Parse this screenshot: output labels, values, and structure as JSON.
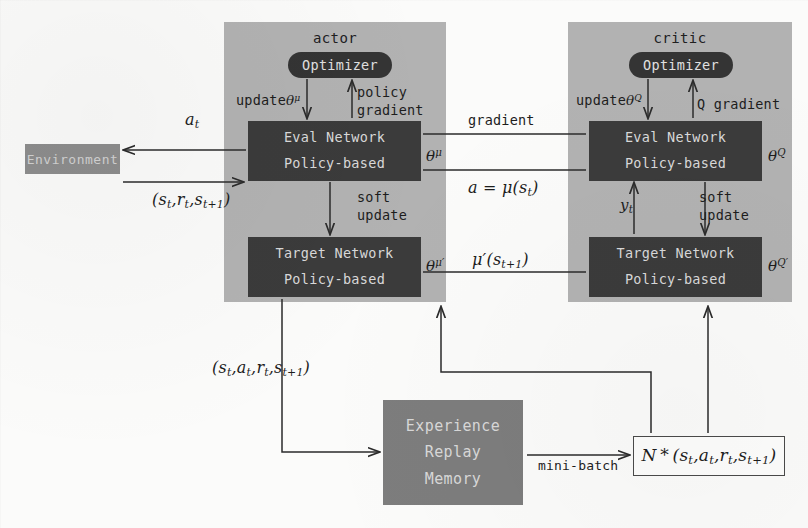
{
  "figure": {
    "kind": "ddpg-architecture-diagram",
    "colors": {
      "panel": "#b2b2b2",
      "network_box": "#3b3b3b",
      "optimizer": "#343434",
      "environment": "#8d8d8d",
      "memory": "#7d7d7d",
      "page": "#fbfbfa",
      "wire": "#2b2b2b"
    }
  },
  "actor": {
    "title": "actor",
    "optimizer": "Optimizer",
    "update_label": "update",
    "update_param": "θ",
    "update_param_sup": "μ",
    "gradient_label_line1": "policy",
    "gradient_label_line2": "gradient",
    "soft_line1": "soft",
    "soft_line2": "update",
    "eval_net": {
      "line1": "Eval Network",
      "line2": "Policy-based"
    },
    "target_net": {
      "line1": "Target Network",
      "line2": "Policy-based"
    },
    "theta_eval": "θ",
    "theta_eval_sup": "μ",
    "theta_target": "θ",
    "theta_target_sup": "μ′"
  },
  "critic": {
    "title": "critic",
    "optimizer": "Optimizer",
    "update_label": "update",
    "update_param": "θ",
    "update_param_sup": "Q",
    "gradient_label": "Q gradient",
    "soft_line1": "soft",
    "soft_line2": "update",
    "eval_net": {
      "line1": "Eval Network",
      "line2": "Policy-based"
    },
    "target_net": {
      "line1": "Target Network",
      "line2": "Policy-based"
    },
    "theta_eval": "θ",
    "theta_eval_sup": "Q",
    "theta_target": "θ",
    "theta_target_sup": "Q′",
    "y_label": "y",
    "y_sub": "t"
  },
  "environment": {
    "label": "Environment",
    "action_label": "a",
    "action_sub": "t",
    "transition_label": "(s_t, r_t, s_{t+1})"
  },
  "interconnect": {
    "gradient": "gradient",
    "action_policy": "a = μ(s_t)",
    "target_policy": "μ′(s_{t+1})"
  },
  "memory": {
    "line1": "Experience",
    "line2": "Replay",
    "line3": "Memory",
    "store_label": "(s_t, a_t, r_t, s_{t+1})",
    "minibatch_label": "mini-batch",
    "batch_label": "N * (s_t, a_t, r_t, s_{t+1})"
  }
}
